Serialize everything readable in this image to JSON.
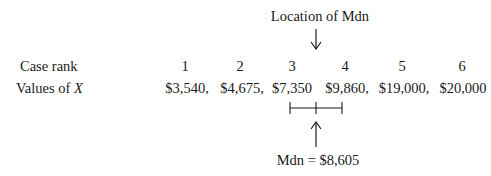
{
  "top_label": "Location of Mdn",
  "bottom_label": "Mdn = $8,605",
  "rows": {
    "rank_label": "Case rank",
    "values_label_prefix": "Values of ",
    "values_label_var": "X"
  },
  "columns": [
    {
      "rank": "1",
      "value": "$3,540,"
    },
    {
      "rank": "2",
      "value": "$4,675,"
    },
    {
      "rank": "3",
      "value": "$7,350"
    },
    {
      "rank": "4",
      "value": "$9,860,"
    },
    {
      "rank": "5",
      "value": "$19,000,"
    },
    {
      "rank": "6",
      "value": "$20,000"
    }
  ]
}
